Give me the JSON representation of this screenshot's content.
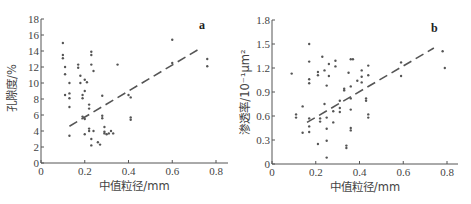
{
  "chart_data": [
    {
      "type": "scatter",
      "panel_label": "a",
      "title": "",
      "xlabel": "中值粒径/mm",
      "ylabel": "孔隙度/%",
      "xlim": [
        0,
        0.85
      ],
      "ylim": [
        0,
        18
      ],
      "xticks": [
        0,
        0.2,
        0.4,
        0.6,
        0.8
      ],
      "xtick_labels": [
        "0",
        "0.2",
        "0.4",
        "0.6",
        "0.8"
      ],
      "yticks": [
        0,
        2,
        4,
        6,
        8,
        10,
        12,
        14,
        16,
        18
      ],
      "ytick_labels": [
        "0",
        "2",
        "4",
        "6",
        "8",
        "10",
        "12",
        "14",
        "16",
        "18"
      ],
      "grid": false,
      "legend": false,
      "series": [
        {
          "name": "samples",
          "marker": "dot",
          "points": [
            [
              0.1,
              15.0
            ],
            [
              0.1,
              13.5
            ],
            [
              0.1,
              13.1
            ],
            [
              0.11,
              12.0
            ],
            [
              0.11,
              11.1
            ],
            [
              0.11,
              8.5
            ],
            [
              0.13,
              10.0
            ],
            [
              0.13,
              8.7
            ],
            [
              0.13,
              8.1
            ],
            [
              0.13,
              7.0
            ],
            [
              0.13,
              3.4
            ],
            [
              0.17,
              12.3
            ],
            [
              0.17,
              11.9
            ],
            [
              0.18,
              10.9
            ],
            [
              0.18,
              10.0
            ],
            [
              0.19,
              8.5
            ],
            [
              0.19,
              8.1
            ],
            [
              0.19,
              5.8
            ],
            [
              0.2,
              10.4
            ],
            [
              0.2,
              9.0
            ],
            [
              0.2,
              5.5
            ],
            [
              0.2,
              3.6
            ],
            [
              0.21,
              10.1
            ],
            [
              0.22,
              7.3
            ],
            [
              0.22,
              6.8
            ],
            [
              0.22,
              4.3
            ],
            [
              0.22,
              4.0
            ],
            [
              0.23,
              13.9
            ],
            [
              0.23,
              13.5
            ],
            [
              0.23,
              12.3
            ],
            [
              0.23,
              3.0
            ],
            [
              0.23,
              2.2
            ],
            [
              0.24,
              11.5
            ],
            [
              0.24,
              4.0
            ],
            [
              0.26,
              2.6
            ],
            [
              0.27,
              2.3
            ],
            [
              0.28,
              8.4
            ],
            [
              0.28,
              5.9
            ],
            [
              0.28,
              5.6
            ],
            [
              0.29,
              4.5
            ],
            [
              0.29,
              3.9
            ],
            [
              0.29,
              3.7
            ],
            [
              0.3,
              3.6
            ],
            [
              0.31,
              3.7
            ],
            [
              0.32,
              4.0
            ],
            [
              0.33,
              3.7
            ],
            [
              0.35,
              12.3
            ],
            [
              0.4,
              8.5
            ],
            [
              0.41,
              8.2
            ],
            [
              0.41,
              5.7
            ],
            [
              0.41,
              5.4
            ],
            [
              0.6,
              15.4
            ],
            [
              0.6,
              12.5
            ],
            [
              0.76,
              13.0
            ],
            [
              0.76,
              12.1
            ]
          ]
        },
        {
          "name": "trend",
          "style": "dashed-line",
          "points": [
            [
              0.13,
              4.6
            ],
            [
              0.72,
              14.2
            ]
          ]
        }
      ]
    },
    {
      "type": "scatter",
      "panel_label": "b",
      "title": "",
      "xlabel": "中值粒径/mm",
      "ylabel": "渗透率/10⁻¹μm²",
      "xlim": [
        0,
        0.85
      ],
      "ylim": [
        0,
        1.8
      ],
      "xticks": [
        0,
        0.2,
        0.4,
        0.6,
        0.8
      ],
      "xtick_labels": [
        "0",
        "0.2",
        "0.4",
        "0.6",
        "0.8"
      ],
      "yticks": [
        0,
        0.3,
        0.6,
        0.9,
        1.2,
        1.5,
        1.8
      ],
      "ytick_labels": [
        "0",
        "0.3",
        "0.6",
        "0.9",
        "1.2",
        "1.5",
        "1.8"
      ],
      "grid": false,
      "legend": false,
      "series": [
        {
          "name": "samples",
          "marker": "dot",
          "points": [
            [
              0.09,
              1.13
            ],
            [
              0.11,
              0.62
            ],
            [
              0.11,
              0.58
            ],
            [
              0.14,
              0.72
            ],
            [
              0.14,
              0.39
            ],
            [
              0.17,
              1.5
            ],
            [
              0.17,
              1.28
            ],
            [
              0.17,
              1.06
            ],
            [
              0.17,
              1.01
            ],
            [
              0.17,
              0.57
            ],
            [
              0.17,
              0.47
            ],
            [
              0.17,
              0.4
            ],
            [
              0.21,
              1.15
            ],
            [
              0.21,
              1.11
            ],
            [
              0.21,
              0.25
            ],
            [
              0.22,
              0.57
            ],
            [
              0.22,
              0.53
            ],
            [
              0.23,
              1.34
            ],
            [
              0.24,
              1.17
            ],
            [
              0.24,
              0.75
            ],
            [
              0.25,
              0.98
            ],
            [
              0.25,
              0.58
            ],
            [
              0.25,
              0.44
            ],
            [
              0.25,
              0.29
            ],
            [
              0.25,
              0.08
            ],
            [
              0.26,
              1.25
            ],
            [
              0.26,
              1.1
            ],
            [
              0.28,
              0.66
            ],
            [
              0.28,
              0.52
            ],
            [
              0.29,
              1.29
            ],
            [
              0.29,
              1.22
            ],
            [
              0.31,
              0.79
            ],
            [
              0.31,
              0.7
            ],
            [
              0.31,
              0.65
            ],
            [
              0.33,
              0.94
            ],
            [
              0.33,
              0.92
            ],
            [
              0.34,
              0.23
            ],
            [
              0.34,
              0.2
            ],
            [
              0.35,
              1.14
            ],
            [
              0.36,
              1.31
            ],
            [
              0.36,
              0.97
            ],
            [
              0.36,
              0.82
            ],
            [
              0.36,
              0.68
            ],
            [
              0.36,
              0.45
            ],
            [
              0.36,
              0.42
            ],
            [
              0.37,
              1.31
            ],
            [
              0.39,
              1.04
            ],
            [
              0.41,
              1.17
            ],
            [
              0.41,
              1.09
            ],
            [
              0.41,
              1.02
            ],
            [
              0.43,
              0.82
            ],
            [
              0.43,
              0.79
            ],
            [
              0.44,
              1.23
            ],
            [
              0.44,
              1.11
            ],
            [
              0.44,
              0.62
            ],
            [
              0.44,
              0.58
            ],
            [
              0.59,
              1.27
            ],
            [
              0.59,
              1.1
            ],
            [
              0.78,
              1.41
            ],
            [
              0.79,
              1.2
            ]
          ]
        },
        {
          "name": "trend",
          "style": "dashed-line",
          "points": [
            [
              0.16,
              0.52
            ],
            [
              0.74,
              1.45
            ]
          ]
        }
      ]
    }
  ],
  "panels": [
    {
      "id": "a",
      "tag": "a",
      "xlabel": "中值粒径/mm",
      "ylabel": "孔隙度/%"
    },
    {
      "id": "b",
      "tag": "b",
      "xlabel": "中值粒径/mm",
      "ylabel": "渗透率/10⁻¹μm²"
    }
  ],
  "colors": {
    "axis": "#555555",
    "points": "#555555",
    "trend": "#555555",
    "text": "#444444"
  }
}
